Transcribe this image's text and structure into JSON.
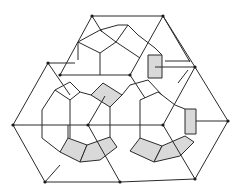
{
  "diagram": {
    "colors": {
      "line": "#2a2a2a",
      "shade": "#d9d9d9",
      "node": "#1a1a1a",
      "background": "#ffffff"
    },
    "nodes": [
      [
        92,
        16
      ],
      [
        163,
        16
      ],
      [
        48,
        63
      ],
      [
        60,
        75
      ],
      [
        130,
        75
      ],
      [
        195,
        67
      ],
      [
        13,
        125
      ],
      [
        88,
        125
      ],
      [
        163,
        125
      ],
      [
        228,
        121
      ],
      [
        45,
        182
      ],
      [
        120,
        182
      ],
      [
        195,
        179
      ]
    ]
  }
}
